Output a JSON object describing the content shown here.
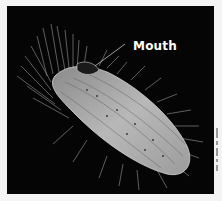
{
  "figure": {
    "background_color": "#050505",
    "border_color": "#f4f4f4",
    "annotations": [
      {
        "label": "Mouth",
        "color": "#ffffff"
      }
    ]
  }
}
